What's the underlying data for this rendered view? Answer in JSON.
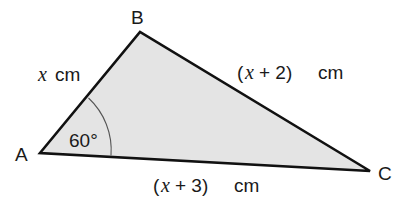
{
  "figure": {
    "type": "triangle",
    "fill_color": "#e4e4e4",
    "stroke_color": "#111111",
    "vertices": {
      "A": {
        "label": "A"
      },
      "B": {
        "label": "B"
      },
      "C": {
        "label": "C"
      }
    },
    "sides": {
      "AB": {
        "var": "x",
        "unit": "cm",
        "text": "x cm"
      },
      "BC": {
        "open": "(",
        "var": "x",
        "rest": " + 2)",
        "unit": "cm",
        "text": "(x + 2) cm"
      },
      "AC": {
        "open": "(",
        "var": "x",
        "rest": " + 3)",
        "unit": "cm",
        "text": "(x + 3) cm"
      }
    },
    "angle": {
      "at": "A",
      "text": "60°",
      "value": 60
    }
  }
}
